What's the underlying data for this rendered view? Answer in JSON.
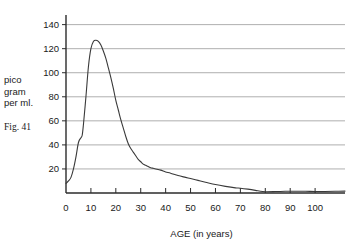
{
  "figure": {
    "caption": "Fig. 41",
    "y_axis_label_lines": [
      "pico",
      "gram",
      "per ml."
    ],
    "x_axis_title": "AGE (in years)"
  },
  "chart_data": {
    "type": "line",
    "title": "",
    "subtitle": "",
    "xlabel": "AGE (in years)",
    "ylabel": "pico gram per ml.",
    "xlim": [
      0,
      112
    ],
    "ylim": [
      0,
      148
    ],
    "xticks": [
      0,
      10,
      20,
      30,
      40,
      50,
      60,
      70,
      80,
      90,
      100
    ],
    "xtick_labels": [
      "0",
      "10",
      "20",
      "30",
      "40",
      "50",
      "60",
      "70",
      "80",
      "90",
      "100"
    ],
    "yticks": [
      20,
      40,
      60,
      80,
      100,
      120,
      140
    ],
    "ytick_labels": [
      "20",
      "40",
      "60",
      "80",
      "100",
      "120",
      "140"
    ],
    "grid": "horizontal",
    "grid_color": "#8c8c8c",
    "line_color": "#3a3a3a",
    "axis_color": "#2b2b2b",
    "legend": null,
    "legend_position": "none",
    "annotations": [],
    "series": [
      {
        "name": "pico gram per ml.",
        "x": [
          0,
          1,
          2,
          3,
          4,
          5,
          6,
          6.5,
          7,
          8,
          9,
          10,
          11,
          12,
          13,
          14,
          15,
          16,
          17,
          18,
          19,
          20,
          21,
          22,
          23,
          24,
          25,
          26,
          27,
          28,
          29,
          30,
          31,
          32,
          33,
          34,
          35,
          36,
          38,
          40,
          42,
          45,
          48,
          50,
          53,
          56,
          60,
          64,
          68,
          70,
          73,
          76,
          78,
          80,
          84,
          88,
          92,
          96,
          100,
          104,
          108,
          112
        ],
        "y": [
          8,
          10,
          13,
          20,
          30,
          42,
          46,
          48,
          57,
          80,
          105,
          120,
          126,
          127,
          126,
          123,
          118,
          112,
          104,
          96,
          87,
          77,
          69,
          61,
          54,
          47,
          41,
          37,
          34,
          31,
          28,
          26,
          24,
          23,
          22,
          21,
          20.5,
          20,
          19,
          17.5,
          16.5,
          14.5,
          13,
          12,
          10.5,
          9,
          7,
          5.5,
          4.3,
          4,
          3.2,
          2.2,
          1.4,
          1.1,
          1.2,
          1.4,
          1.5,
          1.4,
          1.3,
          1.3,
          1.4,
          1.6
        ]
      }
    ]
  }
}
